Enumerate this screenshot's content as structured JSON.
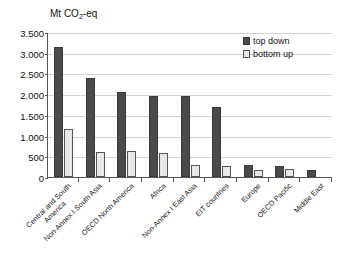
{
  "chart_data": {
    "type": "bar",
    "title": "Mt CO2-eq",
    "title_prefix": "Mt CO",
    "title_sub": "2",
    "title_suffix": "-eq",
    "xlabel": "",
    "ylabel": "Mt CO2-eq",
    "ylim": [
      0,
      3500
    ],
    "grid": true,
    "legend_position": "top-right",
    "ytick_values": [
      0,
      500,
      1000,
      1500,
      2000,
      2500,
      3000,
      3500
    ],
    "ytick_labels": [
      "0",
      "500",
      "1.000",
      "1.500",
      "2.000",
      "2.500",
      "3.000",
      "3.500"
    ],
    "categories": [
      "Central and South America",
      "Non-Annex I South Asia",
      "OECD North America",
      "Africa",
      "Non-Annex I East Asia",
      "EIT countries",
      "Europe",
      "OECD Pacific",
      "Middle East"
    ],
    "category_lines": [
      [
        "Central and South",
        "America"
      ],
      [
        "Non-Annex I South Asia"
      ],
      [
        "OECD North America"
      ],
      [
        "Africa"
      ],
      [
        "Non-Annex I East Asia"
      ],
      [
        "EIT countries"
      ],
      [
        "Europe"
      ],
      [
        "OECD Pacific"
      ],
      [
        "Middle East"
      ]
    ],
    "series": [
      {
        "name": "top down",
        "color": "#4a4a4a",
        "values": [
          3150,
          2380,
          2060,
          1950,
          1950,
          1700,
          300,
          270,
          180
        ]
      },
      {
        "name": "bottom up",
        "color": "#e8e8e8",
        "values": [
          1150,
          600,
          620,
          590,
          300,
          260,
          180,
          190,
          null
        ]
      }
    ]
  },
  "legend": {
    "entries": [
      {
        "label": "top down",
        "swatch": "top-down"
      },
      {
        "label": "bottom up",
        "swatch": "bottom-up"
      }
    ]
  }
}
